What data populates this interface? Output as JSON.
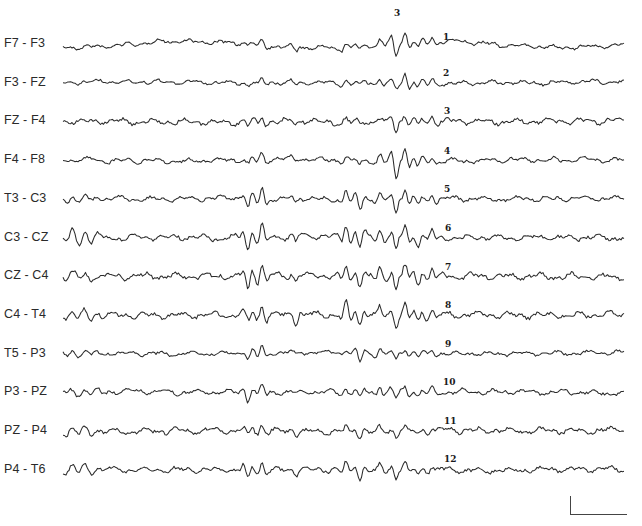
{
  "figure": {
    "type": "eeg-bipolar-montage",
    "channels": [
      {
        "label": "F7 - F3",
        "marker": "1"
      },
      {
        "label": "F3 - FZ",
        "marker": "2"
      },
      {
        "label": "FZ - F4",
        "marker": "3"
      },
      {
        "label": "F4 - F8",
        "marker": "4"
      },
      {
        "label": "T3 - C3",
        "marker": "5"
      },
      {
        "label": "C3 - CZ",
        "marker": "6"
      },
      {
        "label": "CZ - C4",
        "marker": "7"
      },
      {
        "label": "C4 - T4",
        "marker": "8"
      },
      {
        "label": "T5 - P3",
        "marker": "9"
      },
      {
        "label": "P3 - PZ",
        "marker": "10"
      },
      {
        "label": "PZ - P4",
        "marker": "11"
      },
      {
        "label": "P4 - T6",
        "marker": "12"
      }
    ],
    "top_marker": "3",
    "scale_bar": {
      "present": true,
      "vertical_px": 18,
      "horizontal_px": 56
    },
    "trace_color": "#2b2b2b",
    "background": "#ffffff"
  }
}
